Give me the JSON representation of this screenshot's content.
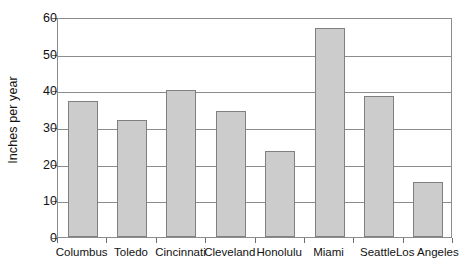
{
  "chart_data": {
    "type": "bar",
    "title": "",
    "subtitle": "",
    "xlabel": "",
    "ylabel": "Inches per year",
    "categories": [
      "Columbus",
      "Toledo",
      "Cincinnati",
      "Cleveland",
      "Honolulu",
      "Miami",
      "Seattle",
      "Los Angeles"
    ],
    "values": [
      37.2,
      32.0,
      40.0,
      34.5,
      23.5,
      57.0,
      38.5,
      15.0
    ],
    "ylim": [
      0,
      60
    ],
    "ytick_labels": [
      "0",
      "10",
      "20",
      "30",
      "40",
      "50",
      "60"
    ],
    "ytick_values": [
      0,
      10,
      20,
      30,
      40,
      50,
      60
    ],
    "grid": "horizontal",
    "legend": "none",
    "bar_fill_color": "#cccccc",
    "bar_border_color": "#808080",
    "axis_color": "#8c8c8c",
    "background_color": "#ffffff"
  },
  "axes": {
    "y_title": "Inches per year"
  }
}
